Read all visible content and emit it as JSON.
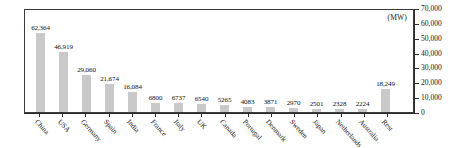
{
  "chart_data": {
    "type": "bar",
    "title": "",
    "subtitle": "",
    "xlabel": "",
    "ylabel": "",
    "unit_label": "(MW)",
    "ylim": [
      0,
      70000
    ],
    "ytick_values": [
      70000,
      60000,
      50000,
      40000,
      30000,
      20000,
      10000,
      0
    ],
    "ytick_labels": [
      "70,000",
      "60,000",
      "50,000",
      "40,000",
      "30,000",
      "20,000",
      "10,000",
      "0"
    ],
    "grid": false,
    "legend": null,
    "bar_color": "#c9c9c9",
    "axis_color": "#2b2b2b",
    "categories": [
      "China",
      "USA",
      "Germany",
      "Spain",
      "India",
      "France",
      "Italy",
      "UK",
      "Canada",
      "Portugal",
      "Denmark",
      "Sweden",
      "Japan",
      "Netherlands",
      "Australia",
      "Rest"
    ],
    "values": [
      62364,
      46919,
      29060,
      21674,
      16084,
      6800,
      6737,
      6540,
      5265,
      4083,
      3871,
      2970,
      2501,
      2328,
      2224,
      18249
    ],
    "value_labels": [
      "62,364",
      "46,919",
      "29,060",
      "21,674",
      "16,084",
      "6800",
      "6737",
      "6540",
      "5265",
      "4083",
      "3871",
      "2970",
      "2501",
      "2328",
      "2224",
      "18,249"
    ]
  }
}
